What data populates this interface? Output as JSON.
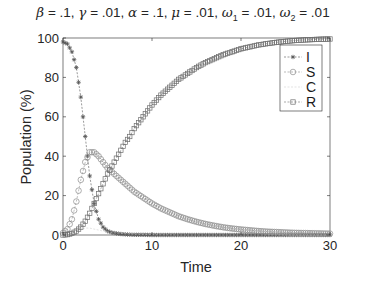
{
  "chart_data": {
    "type": "line",
    "title": "β = .1, γ = .01, α = .1, μ = .01, ω1 = .01, ω2 = .01",
    "title_parts": [
      {
        "sym": "β",
        "val": ".1"
      },
      {
        "sym": "γ",
        "val": ".01"
      },
      {
        "sym": "α",
        "val": ".1"
      },
      {
        "sym": "μ",
        "val": ".01"
      },
      {
        "sym": "ω",
        "sub": "1",
        "val": ".01"
      },
      {
        "sym": "ω",
        "sub": "2",
        "val": ".01"
      }
    ],
    "xlabel": "Time",
    "ylabel": "Population (%)",
    "xlim": [
      0,
      30
    ],
    "ylim": [
      0,
      100
    ],
    "xticks": [
      0,
      10,
      20,
      30
    ],
    "yticks": [
      0,
      20,
      40,
      60,
      80,
      100
    ],
    "grid": false,
    "legend_position": "upper right",
    "x": [
      0,
      0.5,
      1,
      1.5,
      2,
      2.5,
      3,
      3.5,
      4,
      4.5,
      5,
      5.5,
      6,
      6.5,
      7,
      7.5,
      8,
      9,
      10,
      11,
      12,
      13,
      14,
      15,
      16,
      17,
      18,
      19,
      20,
      21,
      22,
      23,
      24,
      25,
      26,
      27,
      28,
      29,
      30
    ],
    "series": [
      {
        "name": "I",
        "marker": "*",
        "color": "#555555",
        "values": [
          98,
          97,
          93,
          85,
          70,
          50,
          30,
          16,
          8,
          4,
          2,
          1.2,
          0.8,
          0.5,
          0.3,
          0.2,
          0.1,
          0.1,
          0,
          0,
          0,
          0,
          0,
          0,
          0,
          0,
          0,
          0,
          0,
          0,
          0,
          0,
          0,
          0,
          0,
          0,
          0,
          0,
          0
        ]
      },
      {
        "name": "S",
        "marker": "o",
        "color": "#8c8c8c",
        "values": [
          1,
          3,
          8,
          17,
          28,
          37,
          42,
          42,
          40,
          37,
          34,
          32,
          30,
          28,
          26,
          24,
          22,
          19,
          16,
          13.5,
          11.5,
          9.5,
          8,
          6.7,
          5.6,
          4.7,
          3.9,
          3.3,
          2.8,
          2.4,
          2,
          1.7,
          1.5,
          1.3,
          1.1,
          1,
          0.9,
          0.8,
          0.7
        ]
      },
      {
        "name": "C",
        "marker": "none",
        "color": "#d0d0d0",
        "values": [
          0,
          0.5,
          1,
          2,
          3,
          3.5,
          3.5,
          3,
          2.5,
          2,
          1.6,
          1.2,
          1,
          0.8,
          0.6,
          0.5,
          0.4,
          0.3,
          0.2,
          0.1,
          0.1,
          0,
          0,
          0,
          0,
          0,
          0,
          0,
          0,
          0,
          0,
          0,
          0,
          0,
          0,
          0,
          0,
          0,
          0
        ]
      },
      {
        "name": "R",
        "marker": "s",
        "color": "#6e6e6e",
        "values": [
          0,
          0.2,
          0.8,
          2,
          4,
          7,
          11,
          16,
          21,
          26,
          31,
          35,
          39,
          43,
          47,
          50,
          54,
          60,
          66,
          71,
          75,
          79,
          82,
          85,
          87.5,
          89.5,
          91.5,
          93,
          94.5,
          95.5,
          96.5,
          97.2,
          97.8,
          98.3,
          98.7,
          99,
          99.2,
          99.4,
          99.5
        ]
      }
    ]
  }
}
